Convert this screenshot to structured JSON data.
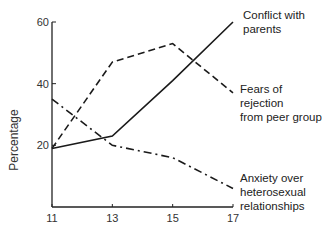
{
  "chart_data": {
    "type": "line",
    "title": "",
    "xlabel": "",
    "ylabel": "Percentage",
    "x": [
      11,
      13,
      15,
      17
    ],
    "x_tick_labels": [
      "11",
      "13",
      "15",
      "17"
    ],
    "y_tick_labels": [
      "20",
      "40",
      "60"
    ],
    "ylim": [
      0,
      60
    ],
    "grid": false,
    "legend_position": "inline-right",
    "series": [
      {
        "name": "Conflict with parents",
        "label_lines": [
          "Conflict with",
          "parents"
        ],
        "style": "solid",
        "values": [
          19,
          23,
          41,
          60
        ]
      },
      {
        "name": "Fears of rejection from peer group",
        "label_lines": [
          "Fears of rejection",
          "from peer group"
        ],
        "style": "dashed",
        "values": [
          19,
          47,
          53,
          37
        ]
      },
      {
        "name": "Anxiety over heterosexual relationships",
        "label_lines": [
          "Anxiety over",
          "heterosexual",
          "relationships"
        ],
        "style": "dash-dot",
        "values": [
          35,
          20,
          16,
          6
        ]
      }
    ]
  }
}
